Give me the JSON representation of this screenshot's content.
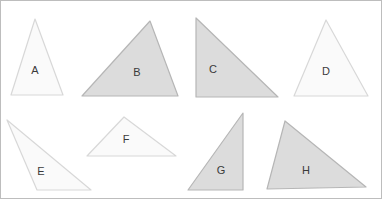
{
  "canvas": {
    "width": 382,
    "height": 199,
    "background_color": "#ffffff",
    "border_color": "#bdbdbd",
    "border_width": 1
  },
  "figure": {
    "title": ""
  },
  "palette": {
    "fill_light": "#fafafa",
    "fill_gray": "#dcdcdc",
    "stroke_light": "#d8d8d8",
    "stroke_gray": "#b6b6b6",
    "label_color": "#3a3a3a"
  },
  "shapes": [
    {
      "label": "A",
      "kind": "triangle",
      "shade": "light",
      "fill": "#fafafa",
      "stroke": "#d8d8d8",
      "points": "35,19 11,95 63,95",
      "label_x": 35,
      "label_y": 71
    },
    {
      "label": "B",
      "kind": "triangle",
      "shade": "gray",
      "fill": "#dcdcdc",
      "stroke": "#b6b6b6",
      "points": "150,21 82,96 178,96",
      "label_x": 137,
      "label_y": 73
    },
    {
      "label": "C",
      "kind": "triangle",
      "shade": "gray",
      "fill": "#dcdcdc",
      "stroke": "#b6b6b6",
      "points": "196,18 196,97 278,97",
      "label_x": 213,
      "label_y": 70
    },
    {
      "label": "D",
      "kind": "triangle",
      "shade": "light",
      "fill": "#fafafa",
      "stroke": "#d8d8d8",
      "points": "326,20 294,96 368,96",
      "label_x": 326,
      "label_y": 72
    },
    {
      "label": "E",
      "kind": "triangle",
      "shade": "light",
      "fill": "#fafafa",
      "stroke": "#d8d8d8",
      "points": "7,120 37,190 91,190",
      "label_x": 41,
      "label_y": 172
    },
    {
      "label": "F",
      "kind": "triangle",
      "shade": "light",
      "fill": "#fafafa",
      "stroke": "#d8d8d8",
      "points": "124,117 87,156 176,156",
      "label_x": 126,
      "label_y": 140
    },
    {
      "label": "G",
      "kind": "triangle",
      "shade": "gray",
      "fill": "#dcdcdc",
      "stroke": "#b6b6b6",
      "points": "243,113 188,190 243,190",
      "label_x": 221,
      "label_y": 171
    },
    {
      "label": "H",
      "kind": "triangle",
      "shade": "gray",
      "fill": "#dcdcdc",
      "stroke": "#b6b6b6",
      "points": "285,121 267,189 366,187",
      "label_x": 306,
      "label_y": 171
    }
  ]
}
